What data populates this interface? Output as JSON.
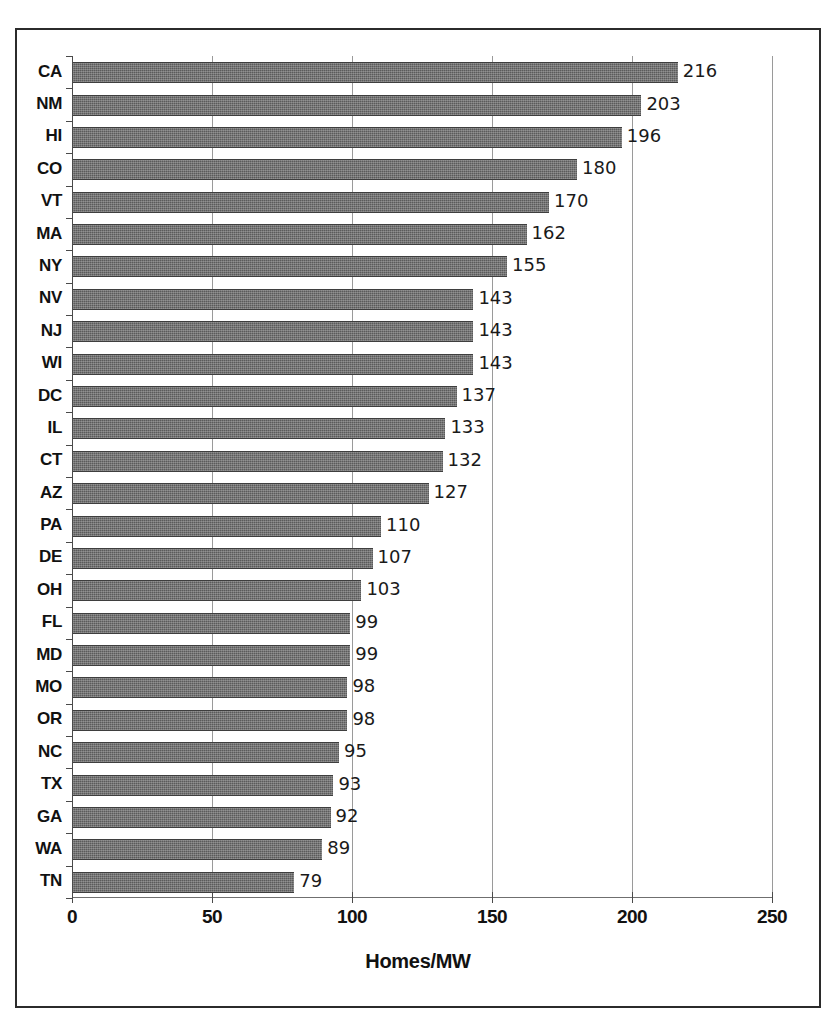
{
  "chart_data": {
    "type": "bar",
    "orientation": "horizontal",
    "title": "",
    "xlabel": "Homes/MW",
    "ylabel": "",
    "xlim": [
      0,
      250
    ],
    "xticks": [
      0,
      50,
      100,
      150,
      200,
      250
    ],
    "xticklabels": [
      "0",
      "50",
      "100",
      "150",
      "200",
      "250"
    ],
    "grid": "vertical",
    "legend": "none",
    "data_labels": true,
    "categories": [
      "CA",
      "NM",
      "HI",
      "CO",
      "VT",
      "MA",
      "NY",
      "NV",
      "NJ",
      "WI",
      "DC",
      "IL",
      "CT",
      "AZ",
      "PA",
      "DE",
      "OH",
      "FL",
      "MD",
      "MO",
      "OR",
      "NC",
      "TX",
      "GA",
      "WA",
      "TN"
    ],
    "values": [
      216,
      203,
      196,
      180,
      170,
      162,
      155,
      143,
      143,
      143,
      137,
      133,
      132,
      127,
      110,
      107,
      103,
      99,
      99,
      98,
      98,
      95,
      93,
      92,
      89,
      79
    ],
    "bars": [
      {
        "category": "CA",
        "value": 216,
        "label": "216"
      },
      {
        "category": "NM",
        "value": 203,
        "label": "203"
      },
      {
        "category": "HI",
        "value": 196,
        "label": "196"
      },
      {
        "category": "CO",
        "value": 180,
        "label": "180"
      },
      {
        "category": "VT",
        "value": 170,
        "label": "170"
      },
      {
        "category": "MA",
        "value": 162,
        "label": "162"
      },
      {
        "category": "NY",
        "value": 155,
        "label": "155"
      },
      {
        "category": "NV",
        "value": 143,
        "label": "143"
      },
      {
        "category": "NJ",
        "value": 143,
        "label": "143"
      },
      {
        "category": "WI",
        "value": 143,
        "label": "143"
      },
      {
        "category": "DC",
        "value": 137,
        "label": "137"
      },
      {
        "category": "IL",
        "value": 133,
        "label": "133"
      },
      {
        "category": "CT",
        "value": 132,
        "label": "132"
      },
      {
        "category": "AZ",
        "value": 127,
        "label": "127"
      },
      {
        "category": "PA",
        "value": 110,
        "label": "110"
      },
      {
        "category": "DE",
        "value": 107,
        "label": "107"
      },
      {
        "category": "OH",
        "value": 103,
        "label": "103"
      },
      {
        "category": "FL",
        "value": 99,
        "label": "99"
      },
      {
        "category": "MD",
        "value": 99,
        "label": "99"
      },
      {
        "category": "MO",
        "value": 98,
        "label": "98"
      },
      {
        "category": "OR",
        "value": 98,
        "label": "98"
      },
      {
        "category": "NC",
        "value": 95,
        "label": "95"
      },
      {
        "category": "TX",
        "value": 93,
        "label": "93"
      },
      {
        "category": "GA",
        "value": 92,
        "label": "92"
      },
      {
        "category": "WA",
        "value": 89,
        "label": "89"
      },
      {
        "category": "TN",
        "value": 79,
        "label": "79"
      }
    ],
    "colors": {
      "bar_fill": "#5b5b5b",
      "bar_edge": "#3e3e3e",
      "gridline": "#9a9a9a",
      "axis": "#4a4a4a",
      "text": "#111111",
      "frame": "#2b2b2b",
      "background": "#ffffff"
    }
  }
}
